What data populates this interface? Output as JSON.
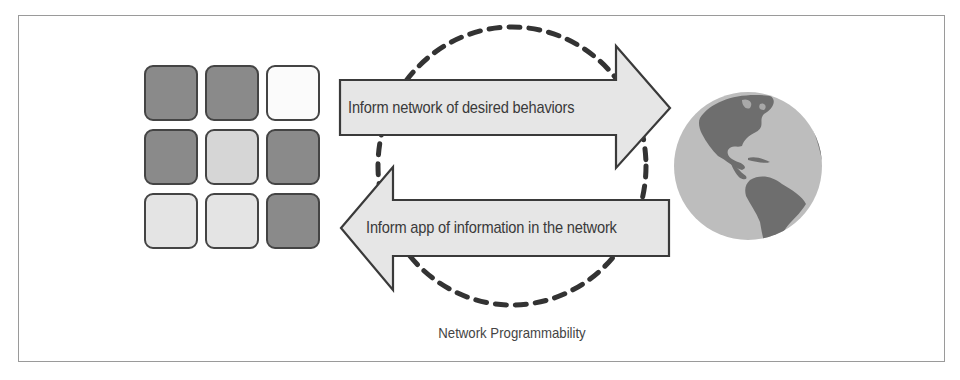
{
  "diagram": {
    "caption": "Network Programmability",
    "arrows": [
      {
        "direction": "right",
        "label": "Inform network of desired behaviors"
      },
      {
        "direction": "left",
        "label": "Inform app of information in the network"
      }
    ],
    "app_grid": {
      "rows": 3,
      "cols": 3,
      "tiles": [
        {
          "shade": "dark",
          "color": "#8a8a8a"
        },
        {
          "shade": "dark",
          "color": "#8a8a8a"
        },
        {
          "shade": "white",
          "color": "#fbfbfb"
        },
        {
          "shade": "dark",
          "color": "#8a8a8a"
        },
        {
          "shade": "light",
          "color": "#d6d6d6"
        },
        {
          "shade": "dark",
          "color": "#8a8a8a"
        },
        {
          "shade": "lighter",
          "color": "#e4e4e4"
        },
        {
          "shade": "lighter",
          "color": "#e4e4e4"
        },
        {
          "shade": "dark",
          "color": "#8a8a8a"
        }
      ]
    },
    "network_icon": "globe-icon",
    "cycle_icon": "dashed-circle",
    "colors": {
      "arrow_fill": "#e6e6e6",
      "arrow_stroke": "#3a3a3a",
      "dash": "#333333",
      "ocean": "#bdbdbd",
      "land": "#6e6e6e",
      "frame": "#9a9a9a"
    }
  }
}
